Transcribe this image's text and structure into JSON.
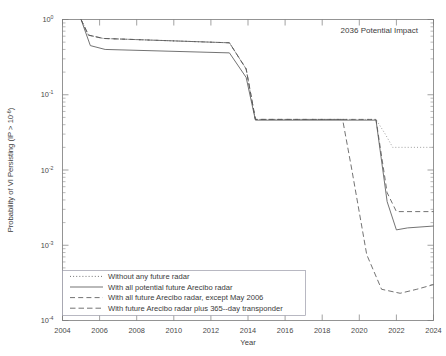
{
  "chart_data": {
    "type": "line",
    "title": "",
    "annotation": "2036 Potential Impact",
    "xlabel": "Year",
    "ylabel_parts": {
      "main": "Probability of VI Persisting (IP > 10",
      "sup": "-6",
      "tail": ")"
    },
    "ylabel": "Probability of VI Persisting (IP > 10^-6)",
    "xlim": [
      2004,
      2024
    ],
    "ylim": [
      0.0001,
      1
    ],
    "yscale": "log",
    "xscale": "linear",
    "grid": false,
    "legend_position": "lower-left",
    "xticks": [
      2004,
      2006,
      2008,
      2010,
      2012,
      2014,
      2016,
      2018,
      2020,
      2022,
      2024
    ],
    "xticklabels": [
      "2004",
      "2006",
      "2008",
      "2010",
      "2012",
      "2014",
      "2016",
      "2018",
      "2020",
      "2022",
      "2024"
    ],
    "yticks": [
      1,
      0.1,
      0.01,
      0.001,
      0.0001
    ],
    "yticklabels": [
      "10^0",
      "10^-1",
      "10^-2",
      "10^-3",
      "10^-4"
    ],
    "ytick_mantissa": "10",
    "ytick_exponents": [
      "0",
      "-1",
      "-2",
      "-3",
      "-4"
    ],
    "series": [
      {
        "name": "Without any future radar",
        "style": "dotted",
        "color": "#8f8f8f",
        "x": [
          2005.0,
          2005.4,
          2006.2,
          2013.0,
          2013.9,
          2014.4,
          2020.9,
          2021.4,
          2021.8,
          2024.0
        ],
        "y": [
          1.0,
          0.62,
          0.56,
          0.49,
          0.22,
          0.047,
          0.047,
          0.03,
          0.02,
          0.02
        ]
      },
      {
        "name": "With all potential future Arecibo radar",
        "style": "solid",
        "color": "#5a5a5a",
        "x": [
          2005.0,
          2005.5,
          2006.3,
          2013.0,
          2013.9,
          2014.4,
          2020.9,
          2021.5,
          2022.0,
          2022.6,
          2024.0
        ],
        "y": [
          1.0,
          0.45,
          0.4,
          0.36,
          0.17,
          0.046,
          0.046,
          0.0038,
          0.0016,
          0.0017,
          0.0018
        ]
      },
      {
        "name": "With all future Arecibo radar, except May 2006",
        "style": "dashed",
        "color": "#5a5a5a",
        "x": [
          2005.0,
          2005.4,
          2006.2,
          2013.0,
          2013.9,
          2014.4,
          2020.9,
          2021.5,
          2022.0,
          2024.0
        ],
        "y": [
          1.0,
          0.62,
          0.56,
          0.49,
          0.22,
          0.047,
          0.047,
          0.005,
          0.0028,
          0.0028
        ]
      },
      {
        "name": "With future Arecibo radar plus 365-day transponder",
        "style": "dashdot",
        "color": "#8f8f8f",
        "x": [
          2005.0,
          2005.4,
          2006.2,
          2013.0,
          2013.9,
          2014.4,
          2019.1,
          2019.6,
          2020.4,
          2021.2,
          2022.2,
          2023.1,
          2024.0
        ],
        "y": [
          1.0,
          0.62,
          0.56,
          0.49,
          0.22,
          0.047,
          0.047,
          0.01,
          0.00075,
          0.00026,
          0.00023,
          0.00026,
          0.0003
        ]
      }
    ]
  },
  "legend": {
    "entries": [
      {
        "label": "Without any future radar"
      },
      {
        "label": "With all potential future Arecibo radar"
      },
      {
        "label": "With all future Arecibo radar, except May 2006"
      },
      {
        "label": "With future Arecibo radar plus 365--day transponder"
      }
    ]
  }
}
